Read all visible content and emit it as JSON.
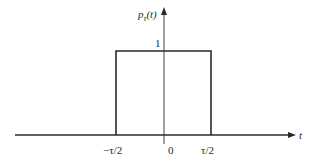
{
  "figure": {
    "type": "rectangular-pulse",
    "y_axis_label": "p",
    "y_axis_label_sub": "τ",
    "y_axis_label_arg": "(t)",
    "x_axis_label": "t",
    "amplitude_label": "1",
    "x_ticks": [
      "−τ/2",
      "0",
      "τ/2"
    ],
    "line_color": "#2a2a2a"
  }
}
